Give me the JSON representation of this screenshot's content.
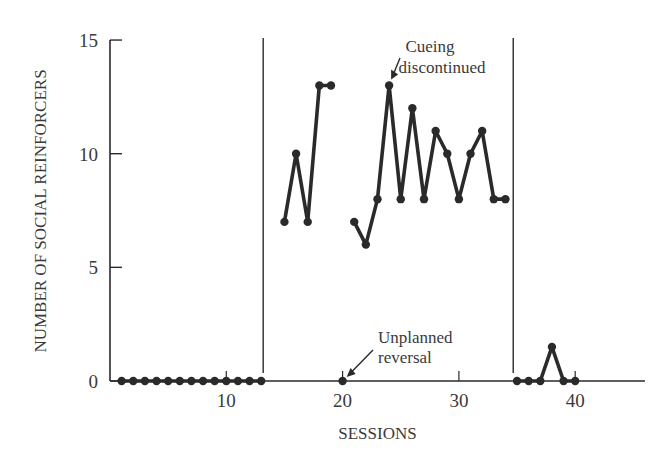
{
  "chart_data": {
    "type": "line",
    "title": "",
    "xlabel": "SESSIONS",
    "ylabel": "NUMBER OF SOCIAL REINFORCERS",
    "xlim": [
      0,
      46
    ],
    "ylim": [
      0,
      15
    ],
    "x_ticks": [
      10,
      20,
      30,
      40
    ],
    "y_ticks": [
      0,
      5,
      10,
      15
    ],
    "grid": false,
    "phase_lines": [
      13,
      34.5
    ],
    "segments": [
      {
        "name": "baseline",
        "points": [
          [
            1,
            0
          ],
          [
            2,
            0
          ],
          [
            3,
            0
          ],
          [
            4,
            0
          ],
          [
            5,
            0
          ],
          [
            6,
            0
          ],
          [
            7,
            0
          ],
          [
            8,
            0
          ],
          [
            9,
            0
          ],
          [
            10,
            0
          ],
          [
            11,
            0
          ],
          [
            12,
            0
          ],
          [
            13,
            0
          ]
        ]
      },
      {
        "name": "treatment-1",
        "points": [
          [
            15,
            7
          ],
          [
            16,
            10
          ],
          [
            17,
            7
          ],
          [
            18,
            13
          ],
          [
            19,
            13
          ]
        ]
      },
      {
        "name": "unplanned-reversal",
        "points": [
          [
            20,
            0
          ]
        ]
      },
      {
        "name": "treatment-2",
        "points": [
          [
            21,
            7
          ],
          [
            22,
            6
          ],
          [
            23,
            8
          ],
          [
            24,
            13
          ],
          [
            25,
            8
          ],
          [
            26,
            12
          ],
          [
            27,
            8
          ],
          [
            28,
            11
          ],
          [
            29,
            10
          ],
          [
            30,
            8
          ],
          [
            31,
            10
          ],
          [
            32,
            11
          ],
          [
            33,
            8
          ],
          [
            34,
            8
          ]
        ]
      },
      {
        "name": "reversal",
        "points": [
          [
            35,
            0
          ],
          [
            36,
            0
          ],
          [
            37,
            0
          ],
          [
            38,
            1.5
          ],
          [
            39,
            0
          ],
          [
            40,
            0
          ]
        ]
      }
    ],
    "annotations": [
      {
        "text": [
          "Cueing",
          "discontinued"
        ],
        "points_to": [
          24,
          13
        ]
      },
      {
        "text": [
          "Unplanned",
          "reversal"
        ],
        "points_to": [
          20,
          0
        ]
      }
    ]
  }
}
